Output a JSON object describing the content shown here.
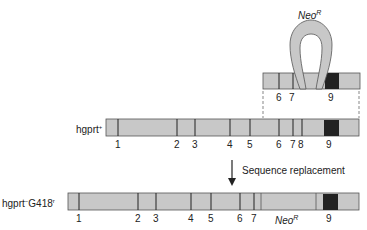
{
  "colors": {
    "exon_fill": "#c8c8c8",
    "dark_exon": "#222222",
    "outline": "#555555",
    "text": "#222222"
  },
  "construct": {
    "insert_label": "Neo",
    "insert_superscript": "R",
    "exon_labels": [
      "6",
      "7",
      "9"
    ]
  },
  "wildtype": {
    "label": "hgprt",
    "label_sup": "+",
    "exon_labels": [
      "1",
      "2",
      "3",
      "4",
      "5",
      "6",
      "7",
      "8",
      "9"
    ]
  },
  "arrow": {
    "label": "Sequence replacement"
  },
  "mutant": {
    "label_main": "hgprt",
    "label_sup1": "−",
    "label_mid": "G418",
    "label_sup2": "r",
    "exon_labels": [
      "1",
      "2",
      "3",
      "4",
      "5",
      "6",
      "7",
      "9"
    ],
    "insert_label": "Neo",
    "insert_superscript": "R"
  }
}
